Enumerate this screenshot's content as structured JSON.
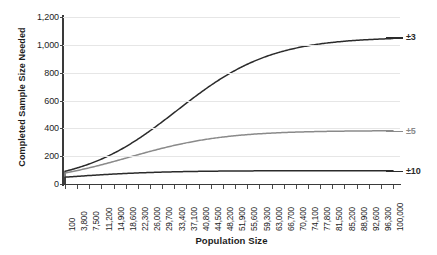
{
  "chart_data": {
    "type": "line",
    "title": "",
    "xlabel": "Population Size",
    "ylabel": "Completed Sample Size Needed",
    "xlim": [
      100,
      100000
    ],
    "ylim": [
      0,
      1200
    ],
    "grid": true,
    "legend_position": "right-inline",
    "y_ticks": [
      0,
      200,
      400,
      600,
      800,
      1000,
      1200
    ],
    "y_tick_labels": [
      "0",
      "200",
      "400",
      "600",
      "800",
      "1,000",
      "1,200"
    ],
    "x_tick_labels": [
      "100",
      "3,800",
      "7,500",
      "11,200",
      "14,900",
      "18,600",
      "22,300",
      "26,000",
      "29,700",
      "33,400",
      "37,100",
      "40,800",
      "44,500",
      "48,200",
      "51,900",
      "55,600",
      "59,300",
      "63,000",
      "66,700",
      "70,400",
      "74,100",
      "77,800",
      "81,500",
      "85,200",
      "88,900",
      "92,600",
      "96,300",
      "100,000"
    ],
    "x_tick_values": [
      100,
      3800,
      7500,
      11200,
      14900,
      18600,
      22300,
      26000,
      29700,
      33400,
      37100,
      40800,
      44500,
      48200,
      51900,
      55600,
      59300,
      63000,
      66700,
      70400,
      74100,
      77800,
      81500,
      85200,
      88900,
      92600,
      96300,
      100000
    ],
    "series": [
      {
        "name": "±3",
        "label": "±3",
        "color": "#2b2b2b",
        "margin_of_error": 3,
        "asymptote": 1056,
        "values": [
          99,
          880,
          964,
          992,
          1005,
          1014,
          1020,
          1024,
          1027,
          1030,
          1032,
          1034,
          1035,
          1036,
          1037,
          1038,
          1039,
          1040,
          1040,
          1041,
          1041,
          1042,
          1042,
          1043,
          1043,
          1043,
          1044,
          1044
        ]
      },
      {
        "name": "±5",
        "label": "±5",
        "color": "#8a8a8a",
        "margin_of_error": 5,
        "asymptote": 384,
        "values": [
          80,
          350,
          365,
          371,
          374,
          375,
          377,
          378,
          378,
          379,
          379,
          380,
          380,
          380,
          380,
          381,
          381,
          381,
          381,
          381,
          381,
          382,
          382,
          382,
          382,
          382,
          382,
          382
        ]
      },
      {
        "name": "±10",
        "label": "±10",
        "color": "#2b2b2b",
        "margin_of_error": 10,
        "asymptote": 96,
        "values": [
          49,
          94,
          95,
          95,
          96,
          96,
          96,
          96,
          96,
          96,
          96,
          96,
          96,
          96,
          96,
          96,
          96,
          96,
          96,
          96,
          96,
          96,
          96,
          96,
          96,
          96,
          96,
          96
        ]
      }
    ],
    "colors": {
      "grid": "#e6e6e6",
      "axis": "#3a3a3a",
      "text": "#1d1d1d",
      "series_dark": "#2b2b2b",
      "series_gray": "#8a8a8a",
      "background": "#ffffff"
    }
  }
}
